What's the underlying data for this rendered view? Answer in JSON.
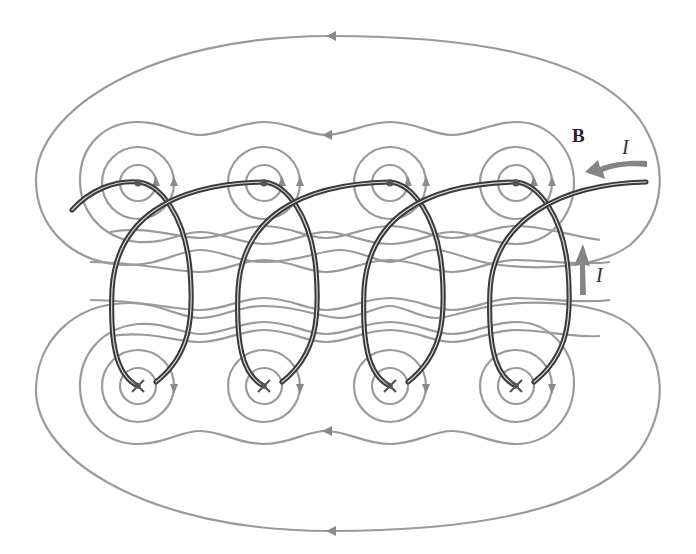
{
  "figure": {
    "labels": {
      "field": "B",
      "current_top": "I",
      "current_side": "I"
    },
    "colors": {
      "field_lines": "#9a9a9a",
      "wire": "#3a3a3a",
      "current_arrow": "#858585",
      "background": "#ffffff"
    },
    "turns": 4,
    "wire_markers": {
      "top_row": "dot (current out of page)",
      "bottom_row": "x (current into page)"
    },
    "circle_columns_x": [
      138,
      264,
      390,
      516
    ],
    "top_row_y": 183,
    "bottom_row_y": 383
  }
}
